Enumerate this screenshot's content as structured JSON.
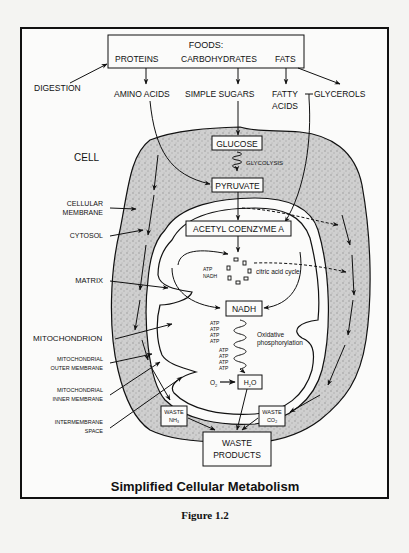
{
  "figure": {
    "title": "Simplified Cellular Metabolism",
    "caption": "Figure 1.2"
  },
  "foods_box": {
    "header": "FOODS:",
    "items": [
      "PROTEINS",
      "CARBOHYDRATES",
      "FATS"
    ]
  },
  "digestion_label": "DIGESTION",
  "digestion_products": {
    "amino_acids": "AMINO ACIDS",
    "simple_sugars": "SIMPLE SUGARS",
    "fatty_acids_line1": "FATTY",
    "fatty_acids_line2": "ACIDS",
    "glycerols": "GLYCEROLS"
  },
  "side_labels": {
    "cell": "CELL",
    "cellular_membrane_1": "CELLULAR",
    "cellular_membrane_2": "MEMBRANE",
    "cytosol": "CYTOSOL",
    "matrix": "MATRIX",
    "mitochondrion": "MITOCHONDRION",
    "outer_membrane_1": "MITOCHONDRIAL",
    "outer_membrane_2": "OUTER MEMBRANE",
    "inner_membrane_1": "MITOCHONDRIAL",
    "inner_membrane_2": "INNER MEMBRANE",
    "intermembrane_1": "INTERMEMBRANE",
    "intermembrane_2": "SPACE"
  },
  "pathway": {
    "glucose": "GLUCOSE",
    "glycolysis": "GLYCOLYSIS",
    "pyruvate": "PYRUVATE",
    "acetyl_coa": "ACETYL COENZYME A",
    "citric_cycle": "citric acid cycle",
    "cycle_atp": "ATP",
    "cycle_nadh": "NADH",
    "nadh": "NADH",
    "oxphos_1": "Oxidative",
    "oxphos_2": "phosphorylation",
    "atp_group_1": [
      "ATP",
      "ATP",
      "ATP",
      "ATP"
    ],
    "atp_group_2": [
      "ATP",
      "ATP",
      "ATP",
      "ATP"
    ],
    "o2": "O",
    "o2_sub": "2",
    "h2o_h": "H",
    "h2o_sub": "2",
    "h2o_o": "O"
  },
  "waste": {
    "nh3_1": "WASTE",
    "nh3_2": "NH",
    "nh3_sub": "3",
    "co2_1": "WASTE",
    "co2_2": "CO",
    "co2_sub": "2",
    "products_1": "WASTE",
    "products_2": "PRODUCTS"
  }
}
